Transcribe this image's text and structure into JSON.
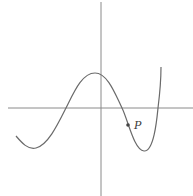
{
  "figure": {
    "type": "function-graph",
    "colors": {
      "axis": "#8a8a8a",
      "curve": "#6a6a6a",
      "point": "#444444",
      "label": "#3a3a3a"
    },
    "axes": {
      "x_axis_y": 108,
      "y_axis_x": 101
    },
    "point": {
      "label": "P",
      "x": 128,
      "y": 125
    }
  }
}
